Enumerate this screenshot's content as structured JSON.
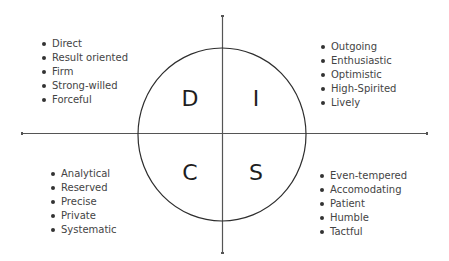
{
  "diagram": {
    "type": "DISC quadrant model",
    "quadrants": [
      {
        "id": "D",
        "letter": "D",
        "position": "top-left",
        "traits": [
          "Direct",
          "Result oriented",
          "Firm",
          "Strong-willed",
          "Forceful"
        ]
      },
      {
        "id": "I",
        "letter": "I",
        "position": "top-right",
        "traits": [
          "Outgoing",
          "Enthusiastic",
          "Optimistic",
          "High-Spirited",
          "Lively"
        ]
      },
      {
        "id": "C",
        "letter": "C",
        "position": "bottom-left",
        "traits": [
          "Analytical",
          "Reserved",
          "Precise",
          "Private",
          "Systematic"
        ]
      },
      {
        "id": "S",
        "letter": "S",
        "position": "bottom-right",
        "traits": [
          "Even-tempered",
          "Accomodating",
          "Patient",
          "Humble",
          "Tactful"
        ]
      }
    ],
    "colors": {
      "line": "#3c3c3c",
      "text": "#444444",
      "letter": "#1e1e1e",
      "background": "#ffffff"
    }
  }
}
